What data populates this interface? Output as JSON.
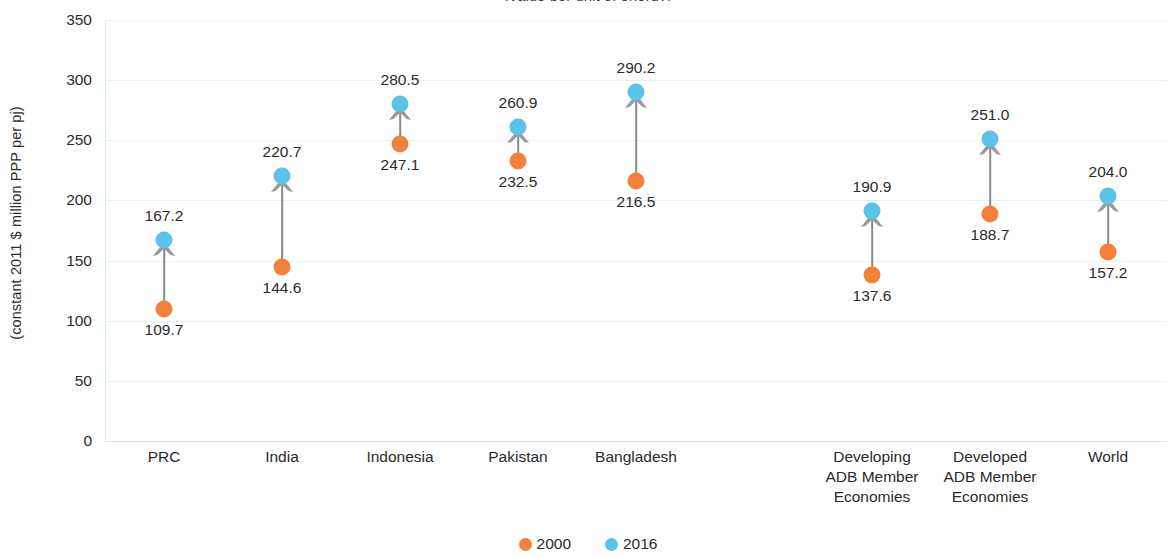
{
  "chart_data": {
    "type": "scatter",
    "title": "(value per unit of energy)",
    "ylabel": "(constant 2011 $ million PPP per pj)",
    "xlabel": "",
    "ylim": [
      0,
      350
    ],
    "yticks": [
      0,
      50,
      100,
      150,
      200,
      250,
      300,
      350
    ],
    "grid": true,
    "legend_position": "bottom-center",
    "categories": [
      "PRC",
      "India",
      "Indonesia",
      "Pakistan",
      "Bangladesh",
      "",
      "Developing\nADB Member\nEconomies",
      "Developed\nADB Member\nEconomies",
      "World"
    ],
    "series": [
      {
        "name": "2000",
        "color": "#f4803c",
        "values": [
          109.7,
          144.6,
          247.1,
          232.5,
          216.5,
          null,
          137.6,
          188.7,
          157.2
        ]
      },
      {
        "name": "2016",
        "color": "#5cc3e8",
        "values": [
          167.2,
          220.7,
          280.5,
          260.9,
          290.2,
          null,
          190.9,
          251.0,
          204.0
        ]
      }
    ]
  },
  "axis": {
    "ylabel": "(constant 2011 $ million PPP per pj)",
    "ticks": [
      "350",
      "300",
      "250",
      "200",
      "150",
      "100",
      "50",
      "0"
    ]
  },
  "categories": [
    {
      "label": "PRC",
      "lines": [
        "PRC"
      ],
      "start": "109.7",
      "end": "167.2"
    },
    {
      "label": "India",
      "lines": [
        "India"
      ],
      "start": "144.6",
      "end": "220.7"
    },
    {
      "label": "Indonesia",
      "lines": [
        "Indonesia"
      ],
      "start": "247.1",
      "end": "280.5"
    },
    {
      "label": "Pakistan",
      "lines": [
        "Pakistan"
      ],
      "start": "232.5",
      "end": "260.9"
    },
    {
      "label": "Bangladesh",
      "lines": [
        "Bangladesh"
      ],
      "start": "216.5",
      "end": "290.2"
    },
    {
      "label": "Developing ADB Member Economies",
      "lines": [
        "Developing",
        "ADB Member",
        "Economies"
      ],
      "start": "137.6",
      "end": "190.9"
    },
    {
      "label": "Developed ADB Member Economies",
      "lines": [
        "Developed",
        "ADB Member",
        "Economies"
      ],
      "start": "188.7",
      "end": "251.0"
    },
    {
      "label": "World",
      "lines": [
        "World"
      ],
      "start": "157.2",
      "end": "204.0"
    }
  ],
  "legend": [
    {
      "label": "2000",
      "color": "#f4803c"
    },
    {
      "label": "2016",
      "color": "#5cc3e8"
    }
  ],
  "colors": {
    "start_marker": "#f4803c",
    "end_marker": "#5cc3e8",
    "connector": "#8a8a8a",
    "gridline": "#e3f4f7",
    "axis": "#cfe9ef",
    "text": "#2b2b2b"
  },
  "title": "(value per unit of energy)"
}
